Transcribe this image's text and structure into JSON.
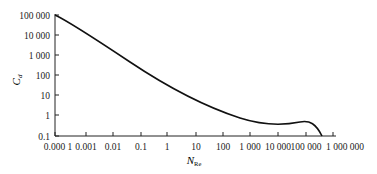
{
  "chart_data": {
    "type": "line",
    "title": "",
    "xlabel": "N_Re",
    "ylabel": "C_d",
    "xscale": "log",
    "yscale": "log",
    "xlim": [
      0.0001,
      1000000
    ],
    "ylim": [
      0.1,
      100000
    ],
    "grid": false,
    "legend": null,
    "x_tick_labels": [
      "0.000 1",
      "0.001",
      "0.01",
      "0.1",
      "1",
      "10",
      "100",
      "1 000",
      "10 000",
      "100 000",
      "1 000 000"
    ],
    "y_tick_labels": [
      "100 000",
      "10 000",
      "1 000",
      "100",
      "10",
      "1",
      "0.1"
    ],
    "series": [
      {
        "name": "Drag coefficient",
        "x": [
          0.0001,
          0.001,
          0.01,
          0.1,
          1,
          10,
          100,
          1000,
          5000,
          10000,
          100000,
          200000,
          300000
        ],
        "y": [
          100000,
          24000,
          2400,
          240,
          26,
          4.2,
          1.1,
          0.46,
          0.38,
          0.4,
          0.47,
          0.35,
          0.1
        ]
      }
    ]
  },
  "labels": {
    "ylabel_main": "C",
    "ylabel_sub": "d",
    "xlabel_main": "N",
    "xlabel_sub": "Re"
  }
}
